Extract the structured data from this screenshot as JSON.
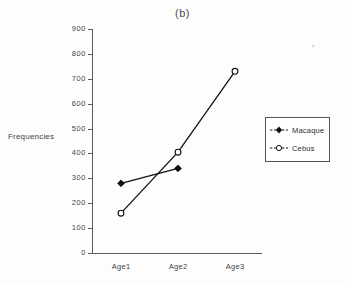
{
  "chart_data": {
    "type": "line",
    "title": "(b)",
    "xlabel": "",
    "ylabel": "Frequencies",
    "categories": [
      "Age1",
      "Age2",
      "Age3"
    ],
    "ylim": [
      0,
      900
    ],
    "yticks": [
      0,
      100,
      200,
      300,
      400,
      500,
      600,
      700,
      800,
      900
    ],
    "ytick_labels": [
      "0",
      "100",
      "200",
      "300",
      "400",
      "500",
      "600",
      "700",
      "800",
      "900"
    ],
    "grid": false,
    "legend_position": "right-outside",
    "series": [
      {
        "name": "Macaque",
        "marker": "filled-diamond",
        "color": "#111111",
        "values": [
          280,
          340,
          null
        ]
      },
      {
        "name": "Cebus",
        "marker": "open-circle",
        "color": "#111111",
        "values": [
          160,
          405,
          730
        ]
      }
    ]
  },
  "legend": {
    "entries": [
      {
        "label": "Macaque",
        "marker": "filled-diamond"
      },
      {
        "label": "Cebus",
        "marker": "open-circle"
      }
    ]
  },
  "colors": {
    "axis": "#5b5b5b",
    "text": "#3f3f3f",
    "background": "#fdfdfd",
    "series": "#111111"
  }
}
